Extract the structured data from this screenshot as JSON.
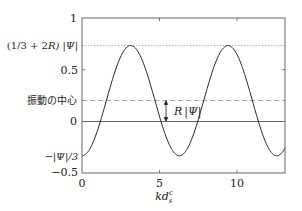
{
  "chart_data": {
    "type": "line",
    "title": "",
    "xlabel": "kd_s^c",
    "ylabel": "",
    "xlim": [
      0,
      13.1
    ],
    "ylim": [
      -0.5,
      1
    ],
    "grid": false,
    "legend": null,
    "x_ticks": [
      {
        "value": 0,
        "label": "0"
      },
      {
        "value": 5,
        "label": "5"
      },
      {
        "value": 10,
        "label": "10"
      }
    ],
    "y_ticks": [
      {
        "value": 1,
        "label": "1"
      },
      {
        "value": 0.7333,
        "label": "(1/3 + 2R) |Ψ|"
      },
      {
        "value": 0.5,
        "label": "0.5"
      },
      {
        "value": 0.2,
        "label": "振動の中心"
      },
      {
        "value": 0,
        "label": "0"
      },
      {
        "value": -0.3333,
        "label": "−|Ψ|/3"
      },
      {
        "value": -0.5,
        "label": "−0.5"
      }
    ],
    "series": [
      {
        "name": "oscillation",
        "formula": "y = 0.2 - 0.5333*cos(x)",
        "x": [
          0,
          1,
          2,
          3,
          3.14,
          4,
          5,
          6,
          6.28,
          7,
          8,
          9,
          9.42,
          10,
          11,
          12,
          12.57,
          13.1
        ],
        "values": [
          -0.333,
          -0.088,
          0.422,
          0.728,
          0.733,
          0.549,
          0.049,
          -0.312,
          -0.333,
          -0.202,
          0.278,
          0.686,
          0.733,
          0.647,
          0.147,
          -0.25,
          -0.333,
          -0.308
        ]
      }
    ],
    "reference_lines": [
      {
        "y": 0.7333,
        "style": "dotted",
        "label": "(1/3 + 2R) |Ψ|"
      },
      {
        "y": 0.2,
        "style": "dashed",
        "label": "振動の中心"
      },
      {
        "y": 0,
        "style": "solid",
        "label": "0"
      }
    ],
    "annotations": [
      {
        "type": "double-arrow",
        "x": 5.4,
        "y_from": 0,
        "y_to": 0.2,
        "label": "R|Ψ|"
      }
    ]
  },
  "labels": {
    "y_one": "1",
    "y_peak_a": "(1/3 + 2",
    "y_peak_R": "R",
    "y_peak_b": ") |Ψ|",
    "y_half": "0.5",
    "y_center": "振動の中心",
    "y_zero": "0",
    "y_min": "−|Ψ|/3",
    "y_neg_half": "−0.5",
    "x_zero": "0",
    "x_five": "5",
    "x_ten": "10",
    "x_axis_main": "kd",
    "x_axis_sup": "c",
    "x_axis_sub": "s",
    "annot_R": "R",
    "annot_psi": "|Ψ|"
  }
}
